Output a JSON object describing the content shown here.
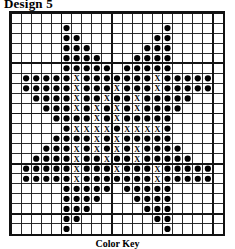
{
  "title": "Design 5",
  "footer_caption": "Color Key",
  "chart_data": {
    "type": "heatmap",
    "title": "Design 5",
    "subtitle": "Color Key",
    "grid": {
      "columns": 21,
      "rows": 22,
      "cell_px": 10.1,
      "bold_line_every": 5,
      "grid": true
    },
    "symbols": [
      {
        "key": "dot",
        "glyph": "●",
        "label": "filled stitch",
        "color": "#000000"
      },
      {
        "key": "cross",
        "glyph": "X",
        "label": "cross stitch",
        "color": "#000000"
      },
      {
        "key": "empty",
        "glyph": "",
        "label": "no stitch",
        "color": "#ffffff"
      }
    ],
    "legend_position": "bottom",
    "xlabel": "",
    "ylabel": "",
    "counts": {
      "dot": 230,
      "cross": 30
    },
    "cells": [
      ".....................",
      ".....O.........O.....",
      ".....OO.......OO.....",
      ".....OOO.....OOO.....",
      ".....OOOO...OOOO.....",
      ".....OOOOO.OOOOO.....",
      ".OOOOOXOOOOOOOXOOOOO.",
      ".OOOOOXOOOXOOOXOOOOO.",
      "..OOOOXOOXOOXOOOOO...",
      "...OOOXOXOXOXOOOO....",
      "....OOOOXOXOOOOO.....",
      ".....OXXXXOXXXXO.....",
      "....OOOOXOXOOOOO.....",
      "...OOOXOXOXOXOOOO....",
      "..OOOOXOOXOOXOOOOO...",
      ".OOOOOXOOOXOOOXOOOOO.",
      ".OOOOOXOOOOOOOXOOOOO.",
      ".....OOOOO.OOOOO.....",
      ".....OOOO...OOOO.....",
      ".....OOO.....OOO.....",
      ".....OO.......OO.....",
      ".....O.........O....."
    ],
    "legend_note": "O = filled dot stitch, X = cross symbol stitch, . = empty square"
  }
}
